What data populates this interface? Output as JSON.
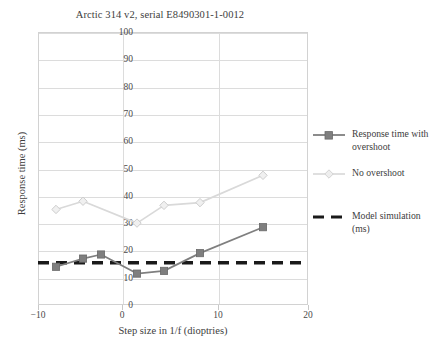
{
  "chart_data": {
    "type": "line",
    "title": "Arctic 314 v2, serial E8490301-1-0012",
    "xlabel": "Step size in 1/f (dioptries)",
    "ylabel": "Response time (ms)",
    "xlim": [
      -10,
      20
    ],
    "ylim": [
      0,
      100
    ],
    "xticks": [
      -10,
      0,
      10,
      20
    ],
    "xtick_labels": [
      "−10",
      "0",
      "10",
      "20"
    ],
    "yticks": [
      0,
      10,
      20,
      30,
      40,
      50,
      60,
      70,
      80,
      90,
      100
    ],
    "ytick_labels": [
      "0",
      "10",
      "20",
      "30",
      "40",
      "50",
      "60",
      "70",
      "80",
      "90",
      "100"
    ],
    "grid": true,
    "legend_position": "right",
    "series": [
      {
        "name": "Response time with overshoot",
        "legend_label_line1": "Response time with",
        "legend_label_line2": "overshoot",
        "color": "#7f7f7f",
        "marker": "square",
        "linestyle": "solid",
        "x": [
          -8.0,
          -5.0,
          -3.0,
          1.0,
          4.0,
          8.0,
          15.0
        ],
        "y": [
          14.0,
          17.0,
          18.5,
          11.5,
          12.5,
          19.0,
          28.5
        ]
      },
      {
        "name": "No overshoot",
        "legend_label_line1": "No overshoot",
        "legend_label_line2": "",
        "color": "#d9d9d9",
        "marker": "diamond",
        "linestyle": "solid",
        "x": [
          -8.0,
          -5.0,
          1.0,
          4.0,
          8.0,
          15.0
        ],
        "y": [
          35.0,
          38.0,
          30.0,
          36.5,
          37.5,
          47.5
        ]
      },
      {
        "name": "Model simulation (ms)",
        "legend_label_line1": "Model simulation",
        "legend_label_line2": "(ms)",
        "color": "#1a1a1a",
        "marker": "none",
        "linestyle": "dashed",
        "x": [
          -10.0,
          20.0
        ],
        "y": [
          15.5,
          15.5
        ],
        "constant_value": 15.5
      }
    ],
    "colors": {
      "axis": "#d2d2d2",
      "grid": "#dcdcdc",
      "text": "#3d3d3d",
      "background": "#ffffff"
    }
  }
}
